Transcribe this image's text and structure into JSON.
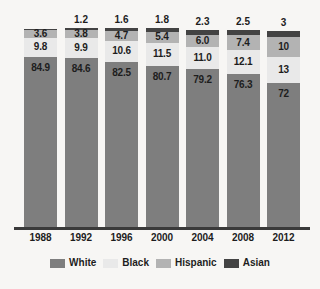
{
  "chart_data": {
    "type": "bar",
    "stacked": true,
    "orientation": "vertical",
    "title": "",
    "subtitle": "",
    "xlabel": "",
    "ylabel": "",
    "ylim": [
      0,
      100
    ],
    "grid": false,
    "legend_position": "bottom",
    "value_units": "percent",
    "categories": [
      "1988",
      "1992",
      "1996",
      "2000",
      "2004",
      "2008",
      "2012"
    ],
    "stack_order_bottom_to_top": [
      "White",
      "Black",
      "Hispanic",
      "Asian"
    ],
    "series": [
      {
        "name": "White",
        "color": "#7e7e7e",
        "values": [
          84.9,
          84.6,
          82.5,
          80.7,
          79.2,
          76.3,
          72
        ],
        "labels": [
          "84.9",
          "84.6",
          "82.5",
          "80.7",
          "79.2",
          "76.3",
          "72"
        ],
        "label_placement": "inside"
      },
      {
        "name": "Black",
        "color": "#e9e9e9",
        "values": [
          9.8,
          9.9,
          10.6,
          11.5,
          11.0,
          12.1,
          13
        ],
        "labels": [
          "9.8",
          "9.9",
          "10.6",
          "11.5",
          "11.0",
          "12.1",
          "13"
        ],
        "label_placement": "inside"
      },
      {
        "name": "Hispanic",
        "color": "#b3b3b3",
        "values": [
          3.6,
          3.8,
          4.7,
          5.4,
          6.0,
          7.4,
          10
        ],
        "labels": [
          "3.6",
          "3.8",
          "4.7",
          "5.4",
          "6.0",
          "7.4",
          "10"
        ],
        "label_placement": "inside"
      },
      {
        "name": "Asian",
        "color": "#434343",
        "values": [
          0.9,
          1.2,
          1.6,
          1.8,
          2.3,
          2.5,
          3
        ],
        "labels": [
          "",
          "1.2",
          "1.6",
          "1.8",
          "2.3",
          "2.5",
          "3"
        ],
        "label_placement": "above"
      }
    ]
  },
  "axis": {
    "tick_labels": [
      "1988",
      "1992",
      "1996",
      "2000",
      "2004",
      "2008",
      "2012"
    ]
  },
  "legend": {
    "items": [
      {
        "label": "White",
        "color": "#7e7e7e"
      },
      {
        "label": "Black",
        "color": "#e9e9e9"
      },
      {
        "label": "Hispanic",
        "color": "#b3b3b3"
      },
      {
        "label": "Asian",
        "color": "#434343"
      }
    ]
  },
  "colors": {
    "background": "#f7f6f4",
    "axis": "#3a3a3a",
    "text": "#1d1d1d"
  }
}
